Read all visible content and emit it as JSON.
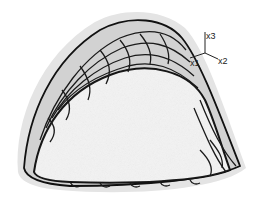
{
  "figure": {
    "colors": {
      "background": "#ffffff",
      "outer_halo": "#e2e2e2",
      "band_fill": "#d4d4d4",
      "inner_face": "#f4f4f4",
      "contour_lines": "#1a1a1a"
    }
  },
  "axes": {
    "x1": "x1",
    "x2": "x2",
    "x3": "x3"
  }
}
